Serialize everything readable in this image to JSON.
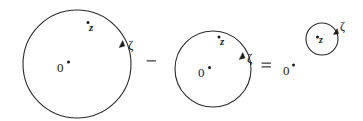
{
  "figure": {
    "background_color": "#ffffff",
    "stroke_color": "#2b2b2b",
    "text_color": "#1b1b1b",
    "width": 363,
    "height": 121
  },
  "operators": {
    "minus": "–",
    "equals": "="
  },
  "groups": [
    {
      "id": "term-1",
      "circle": {
        "cx": 77,
        "cy": 64,
        "r": 54,
        "stroke_width": 1.1
      },
      "arrow": {
        "x": 122,
        "y": 43,
        "angle_deg": -65
      },
      "labels": {
        "z": "z",
        "zero": "0",
        "zeta": "ζ"
      }
    },
    {
      "id": "term-2",
      "circle": {
        "cx": 213,
        "cy": 69,
        "r": 38,
        "stroke_width": 1.1
      },
      "arrow": {
        "x": 242,
        "y": 55,
        "angle_deg": -62
      },
      "labels": {
        "z": "z",
        "zero": "0",
        "zeta": "ζ"
      }
    },
    {
      "id": "term-3",
      "circle": {
        "cx": 322,
        "cy": 39,
        "r": 16,
        "stroke_width": 1.1
      },
      "arrow": {
        "x": 336,
        "y": 30,
        "angle_deg": -55
      },
      "labels": {
        "z": "z",
        "zero": "0",
        "zeta": "ζ"
      }
    }
  ]
}
